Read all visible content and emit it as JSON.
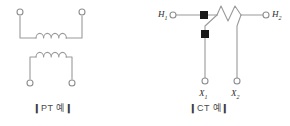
{
  "figure": {
    "background_color": "#ffffff",
    "line_color": "#9a9a9a",
    "marker_fill_color": "#1a1a1a",
    "label_color": "#2b2b2b",
    "width": 290,
    "height": 126
  },
  "pt_diagram": {
    "caption": "PT 예",
    "caption_bar_left": "❙",
    "caption_bar_right": "❙",
    "primary_winding": {
      "name": "primary-coil",
      "turns": 4,
      "terminal_left": "terminal-open-circle",
      "terminal_right": "terminal-open-circle"
    },
    "secondary_winding": {
      "name": "secondary-coil",
      "turns": 4,
      "terminal_left": "terminal-open-circle",
      "terminal_right": "terminal-open-circle"
    }
  },
  "ct_diagram": {
    "caption": "CT 예",
    "caption_bar_left": "❙",
    "caption_bar_right": "❙",
    "primary_terminals": [
      {
        "label": "H",
        "subscript": "1",
        "marker": "terminal-open-circle"
      },
      {
        "label": "H",
        "subscript": "2",
        "marker": "terminal-open-circle"
      }
    ],
    "secondary_terminals": [
      {
        "label": "X",
        "subscript": "1",
        "marker": "terminal-open-circle"
      },
      {
        "label": "X",
        "subscript": "2",
        "marker": "terminal-open-circle"
      }
    ],
    "polarity_markers": [
      {
        "name": "polarity-mark-primary",
        "shape": "filled-square"
      },
      {
        "name": "polarity-mark-secondary",
        "shape": "filled-square"
      }
    ],
    "core_winding": {
      "name": "ct-zigzag-winding",
      "peaks": 2
    }
  }
}
